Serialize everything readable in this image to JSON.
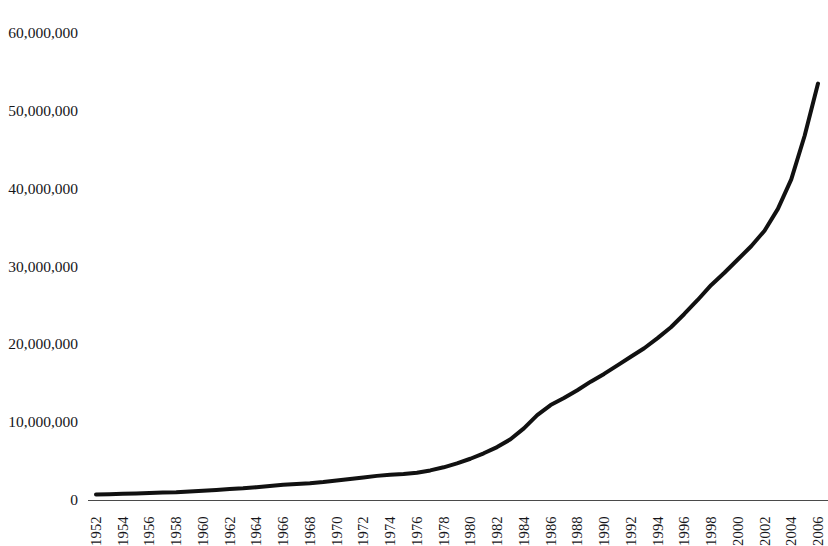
{
  "title_strip": "",
  "chart_data": {
    "type": "line",
    "title": "",
    "subtitle": "",
    "xlabel": "",
    "ylabel": "",
    "xlim": [
      1952,
      2006
    ],
    "ylim": [
      0,
      60000000
    ],
    "grid": false,
    "legend": false,
    "legend_position": "none",
    "line_color": "#111111",
    "line_width_px": 4,
    "background_color": "#ffffff",
    "y_ticks": [
      0,
      10000000,
      20000000,
      30000000,
      40000000,
      50000000,
      60000000
    ],
    "y_tick_labels": [
      "0",
      "10,000,000",
      "20,000,000",
      "30,000,000",
      "40,000,000",
      "50,000,000",
      "60,000,000"
    ],
    "x_tick_labels": [
      "1952",
      "1954",
      "1956",
      "1958",
      "1960",
      "1962",
      "1964",
      "1966",
      "1968",
      "1970",
      "1972",
      "1974",
      "1976",
      "1978",
      "1980",
      "1982",
      "1984",
      "1986",
      "1988",
      "1990",
      "1992",
      "1994",
      "1996",
      "1998",
      "2000",
      "2002",
      "2004",
      "2006"
    ],
    "x_tick_step": 2,
    "series": [
      {
        "name": "value",
        "x": [
          1952,
          1953,
          1954,
          1955,
          1956,
          1957,
          1958,
          1959,
          1960,
          1961,
          1962,
          1963,
          1964,
          1965,
          1966,
          1967,
          1968,
          1969,
          1970,
          1971,
          1972,
          1973,
          1974,
          1975,
          1976,
          1977,
          1978,
          1979,
          1980,
          1981,
          1982,
          1983,
          1984,
          1985,
          1986,
          1987,
          1988,
          1989,
          1990,
          1991,
          1992,
          1993,
          1994,
          1995,
          1996,
          1997,
          1998,
          1999,
          2000,
          2001,
          2002,
          2003,
          2004,
          2005,
          2006
        ],
        "values": [
          700000,
          750000,
          800000,
          850000,
          900000,
          950000,
          1000000,
          1100000,
          1200000,
          1300000,
          1400000,
          1500000,
          1650000,
          1800000,
          1950000,
          2050000,
          2150000,
          2300000,
          2500000,
          2700000,
          2900000,
          3100000,
          3250000,
          3350000,
          3500000,
          3800000,
          4200000,
          4700000,
          5300000,
          6000000,
          6800000,
          7800000,
          9200000,
          10900000,
          12200000,
          13100000,
          14100000,
          15200000,
          16200000,
          17300000,
          18400000,
          19500000,
          20800000,
          22200000,
          23900000,
          25700000,
          27600000,
          29200000,
          30900000,
          32600000,
          34600000,
          37400000,
          41200000,
          46800000,
          53500000
        ]
      }
    ]
  }
}
